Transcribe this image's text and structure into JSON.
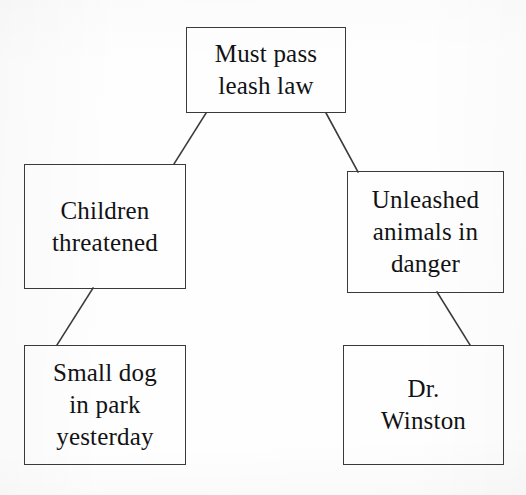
{
  "diagram": {
    "background_color": "#fefefe",
    "ink_color": "#121214",
    "box_border_color": "#3a3a3c",
    "nodes": {
      "claim": {
        "id": "claim",
        "role": "main-claim",
        "text": "Must pass\nleash law"
      },
      "reason_left": {
        "id": "reason-left",
        "role": "supporting-reason",
        "text": "Children\nthreatened"
      },
      "reason_right": {
        "id": "reason-right",
        "role": "supporting-reason",
        "text": "Unleashed\nanimals in\ndanger"
      },
      "evidence_left": {
        "id": "evidence-left",
        "role": "evidence",
        "text": "Small dog\nin park\nyesterday"
      },
      "evidence_right": {
        "id": "evidence-right",
        "role": "evidence",
        "text": "Dr.\nWinston"
      }
    },
    "connectors": [
      {
        "id": "claim-to-reason-left",
        "from": "claim",
        "to": "reason_left",
        "x1": 206,
        "y1": 113,
        "x2": 174,
        "y2": 164
      },
      {
        "id": "claim-to-reason-right",
        "from": "claim",
        "to": "reason_right",
        "x1": 326,
        "y1": 113,
        "x2": 358,
        "y2": 172
      },
      {
        "id": "reason-left-to-evidence",
        "from": "reason_left",
        "to": "evidence_left",
        "x1": 93,
        "y1": 288,
        "x2": 57,
        "y2": 345
      },
      {
        "id": "reason-right-to-evidence",
        "from": "reason_right",
        "to": "evidence_right",
        "x1": 437,
        "y1": 292,
        "x2": 470,
        "y2": 345
      }
    ]
  }
}
